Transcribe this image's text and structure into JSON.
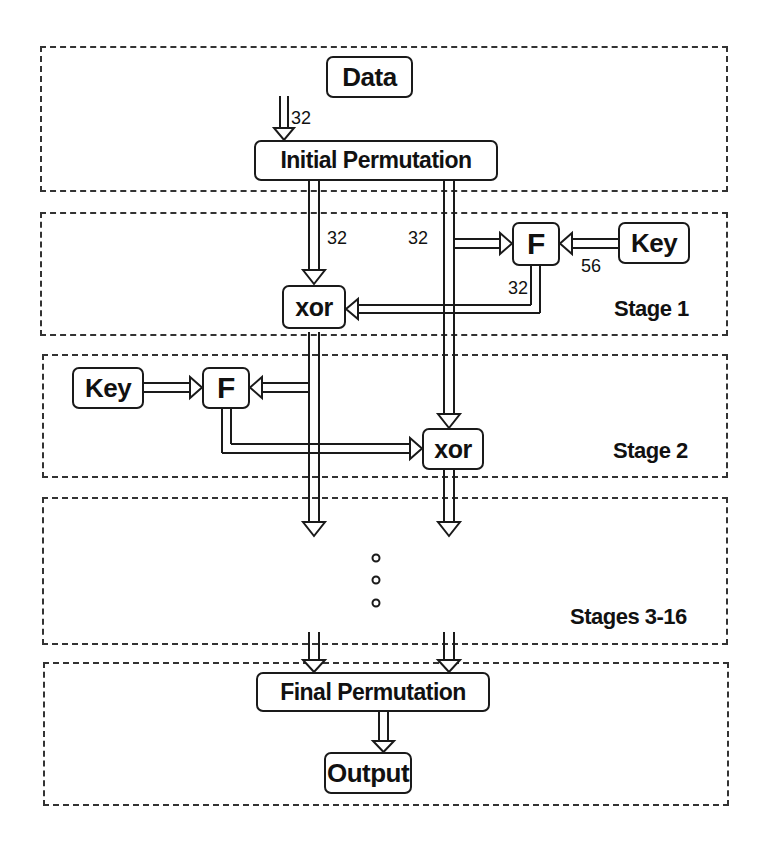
{
  "stages": {
    "input": {
      "label": ""
    },
    "stage1": {
      "label": "Stage 1"
    },
    "stage2": {
      "label": "Stage 2"
    },
    "stages3_16": {
      "label": "Stages 3-16"
    },
    "output": {
      "label": ""
    }
  },
  "blocks": {
    "data": "Data",
    "initial_permutation": "Initial Permutation",
    "f1": "F",
    "key1": "Key",
    "xor1": "xor",
    "key2": "Key",
    "f2": "F",
    "xor2": "xor",
    "final_permutation": "Final Permutation",
    "output": "Output"
  },
  "bit_widths": {
    "data_to_ip": "32",
    "left_half": "32",
    "right_half": "32",
    "key_to_f": "56",
    "f_out": "32"
  },
  "ellipsis": "⋮",
  "colors": {
    "line": "#1a1a1a",
    "border": "#333333",
    "background": "#ffffff"
  }
}
